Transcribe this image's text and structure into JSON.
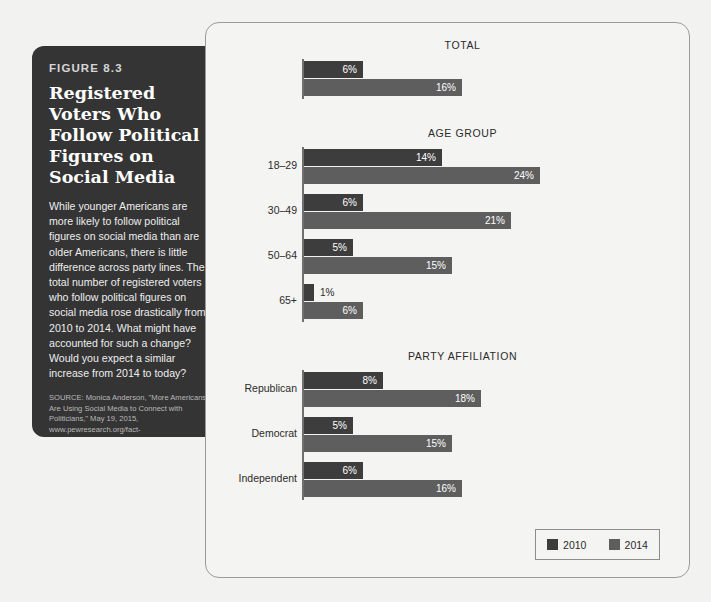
{
  "caption": {
    "figure_number": "FIGURE 8.3",
    "title": "Registered Voters Who Follow Political Figures on Social Media",
    "body": "While younger Americans are more likely to follow political figures on social media than are older Americans, there is little difference across party lines. The total number of registered voters who follow political figures on social media rose drastically from 2010 to 2014. What might have accounted for such a change? Would you expect a similar increase from 2014 to today?",
    "source": "SOURCE: Monica Anderson, \"More Americans Are Using Social Media to Connect with Politicians,\" May 19, 2015, www.pewresearch.org/fact-tank/2015/05/19/more-americans-are-using-social-media-to-connect-with-politicians/ (accessed 3/8/16)."
  },
  "legend": {
    "items": [
      {
        "label": "2010",
        "color": "#3d3d3d"
      },
      {
        "label": "2014",
        "color": "#5e5e5e"
      }
    ]
  },
  "chart_data": {
    "type": "bar",
    "title": "Registered Voters Who Follow Political Figures on Social Media",
    "orientation": "horizontal",
    "xlabel": "",
    "ylabel": "",
    "xlim": [
      0,
      24
    ],
    "grid": false,
    "legend_position": "bottom-right",
    "value_suffix": "%",
    "series_names": [
      "2010",
      "2014"
    ],
    "series_colors": [
      "#3d3d3d",
      "#5e5e5e"
    ],
    "groups": [
      {
        "heading": "TOTAL",
        "categories": [
          {
            "label": "",
            "values": [
              {
                "series": "2010",
                "value": 6,
                "label": "6%"
              },
              {
                "series": "2014",
                "value": 16,
                "label": "16%"
              }
            ]
          }
        ]
      },
      {
        "heading": "AGE GROUP",
        "categories": [
          {
            "label": "18–29",
            "values": [
              {
                "series": "2010",
                "value": 14,
                "label": "14%"
              },
              {
                "series": "2014",
                "value": 24,
                "label": "24%"
              }
            ]
          },
          {
            "label": "30–49",
            "values": [
              {
                "series": "2010",
                "value": 6,
                "label": "6%"
              },
              {
                "series": "2014",
                "value": 21,
                "label": "21%"
              }
            ]
          },
          {
            "label": "50–64",
            "values": [
              {
                "series": "2010",
                "value": 5,
                "label": "5%"
              },
              {
                "series": "2014",
                "value": 15,
                "label": "15%"
              }
            ]
          },
          {
            "label": "65+",
            "values": [
              {
                "series": "2010",
                "value": 1,
                "label": "1%"
              },
              {
                "series": "2014",
                "value": 6,
                "label": "6%"
              }
            ]
          }
        ]
      },
      {
        "heading": "PARTY AFFILIATION",
        "categories": [
          {
            "label": "Republican",
            "values": [
              {
                "series": "2010",
                "value": 8,
                "label": "8%"
              },
              {
                "series": "2014",
                "value": 18,
                "label": "18%"
              }
            ]
          },
          {
            "label": "Democrat",
            "values": [
              {
                "series": "2010",
                "value": 5,
                "label": "5%"
              },
              {
                "series": "2014",
                "value": 15,
                "label": "15%"
              }
            ]
          },
          {
            "label": "Independent",
            "values": [
              {
                "series": "2010",
                "value": 6,
                "label": "6%"
              },
              {
                "series": "2014",
                "value": 16,
                "label": "16%"
              }
            ]
          }
        ]
      }
    ]
  }
}
